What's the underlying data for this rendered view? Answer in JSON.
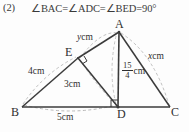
{
  "header": {
    "number": "(2)",
    "equation": "∠BAC=∠ADC=∠BED=90°"
  },
  "figure": {
    "vertices": [
      {
        "name": "A",
        "label": "A",
        "x": 119,
        "y": 32
      },
      {
        "name": "B",
        "label": "B",
        "x": 22,
        "y": 107
      },
      {
        "name": "C",
        "label": "C",
        "x": 170,
        "y": 107
      },
      {
        "name": "D",
        "label": "D",
        "x": 118,
        "y": 107
      },
      {
        "name": "E",
        "label": "E",
        "x": 78,
        "y": 58
      }
    ],
    "labels": {
      "A": "A",
      "B": "B",
      "C": "C",
      "D": "D",
      "E": "E"
    },
    "measures": {
      "be": {
        "text": "4cm",
        "value": "4",
        "unit": "cm"
      },
      "ed": {
        "text": "3cm",
        "value": "3",
        "unit": "cm"
      },
      "bd": {
        "text": "5cm",
        "value": "5",
        "unit": "cm"
      },
      "ae": {
        "variable": "y",
        "unit": "cm"
      },
      "ac": {
        "variable": "x",
        "unit": "cm"
      },
      "ad": {
        "numerator": "15",
        "denominator": "4",
        "unit": "cm"
      }
    },
    "right_angles": [
      "D",
      "E"
    ],
    "colors": {
      "stroke": "#3b3b3b",
      "dashed": "#9a9a9a",
      "text": "#2f2f2f",
      "background": "#fdfdfd"
    }
  }
}
